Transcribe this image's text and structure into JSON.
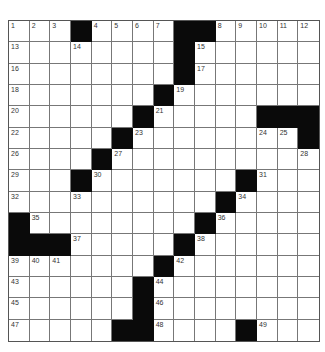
{
  "puzzle": {
    "rows": 15,
    "cols": 15,
    "grid": [
      "...#....##.....",
      "........#......",
      "........#......",
      ".......#.......",
      "......#.....###",
      ".....#......#.#",
      "....#..........",
      "...#.......#...",
      "..........#....",
      "#........#.....",
      "###.....#......",
      ".......#.......",
      "......#........",
      "......#........",
      ".....##....#..."
    ],
    "grid_fixed": [
      "...#....##.....",
      "........#......",
      "........#......",
      ".......#.......",
      "......#.....###",
      ".....#........#",
      "....#..........",
      "...#.......#...",
      "..........#....",
      "#........#.....",
      "###.....#......",
      ".......#.......",
      "......#........",
      "......#........",
      ".....##....#..."
    ],
    "numbers": [
      {
        "r": 0,
        "c": 0,
        "n": "1"
      },
      {
        "r": 0,
        "c": 1,
        "n": "2"
      },
      {
        "r": 0,
        "c": 2,
        "n": "3"
      },
      {
        "r": 0,
        "c": 4,
        "n": "4"
      },
      {
        "r": 0,
        "c": 5,
        "n": "5"
      },
      {
        "r": 0,
        "c": 6,
        "n": "6"
      },
      {
        "r": 0,
        "c": 7,
        "n": "7"
      },
      {
        "r": 0,
        "c": 10,
        "n": "8"
      },
      {
        "r": 0,
        "c": 11,
        "n": "9"
      },
      {
        "r": 0,
        "c": 12,
        "n": "10"
      },
      {
        "r": 0,
        "c": 13,
        "n": "11"
      },
      {
        "r": 0,
        "c": 14,
        "n": "12"
      },
      {
        "r": 1,
        "c": 0,
        "n": "13"
      },
      {
        "r": 1,
        "c": 3,
        "n": "14"
      },
      {
        "r": 1,
        "c": 9,
        "n": "15"
      },
      {
        "r": 2,
        "c": 0,
        "n": "16"
      },
      {
        "r": 2,
        "c": 9,
        "n": "17"
      },
      {
        "r": 3,
        "c": 0,
        "n": "18"
      },
      {
        "r": 3,
        "c": 8,
        "n": "19"
      },
      {
        "r": 4,
        "c": 0,
        "n": "20"
      },
      {
        "r": 4,
        "c": 7,
        "n": "21"
      },
      {
        "r": 5,
        "c": 0,
        "n": "22"
      },
      {
        "r": 5,
        "c": 6,
        "n": "23"
      },
      {
        "r": 5,
        "c": 12,
        "n": "24"
      },
      {
        "r": 5,
        "c": 13,
        "n": "25"
      },
      {
        "r": 6,
        "c": 0,
        "n": "26"
      },
      {
        "r": 6,
        "c": 5,
        "n": "27"
      },
      {
        "r": 6,
        "c": 14,
        "n": "28"
      },
      {
        "r": 7,
        "c": 0,
        "n": "29"
      },
      {
        "r": 7,
        "c": 4,
        "n": "30"
      },
      {
        "r": 7,
        "c": 12,
        "n": "31"
      },
      {
        "r": 8,
        "c": 0,
        "n": "32"
      },
      {
        "r": 8,
        "c": 3,
        "n": "33"
      },
      {
        "r": 8,
        "c": 11,
        "n": "34"
      },
      {
        "r": 9,
        "c": 1,
        "n": "35"
      },
      {
        "r": 9,
        "c": 10,
        "n": "36"
      },
      {
        "r": 10,
        "c": 3,
        "n": "37"
      },
      {
        "r": 10,
        "c": 9,
        "n": "38"
      },
      {
        "r": 11,
        "c": 0,
        "n": "39"
      },
      {
        "r": 11,
        "c": 1,
        "n": "40"
      },
      {
        "r": 11,
        "c": 2,
        "n": "41"
      },
      {
        "r": 11,
        "c": 8,
        "n": "42"
      },
      {
        "r": 12,
        "c": 0,
        "n": "43"
      },
      {
        "r": 12,
        "c": 7,
        "n": "44"
      },
      {
        "r": 13,
        "c": 0,
        "n": "45"
      },
      {
        "r": 13,
        "c": 7,
        "n": "46"
      },
      {
        "r": 14,
        "c": 0,
        "n": "47"
      },
      {
        "r": 14,
        "c": 7,
        "n": "48"
      },
      {
        "r": 14,
        "c": 12,
        "n": "49"
      }
    ]
  }
}
